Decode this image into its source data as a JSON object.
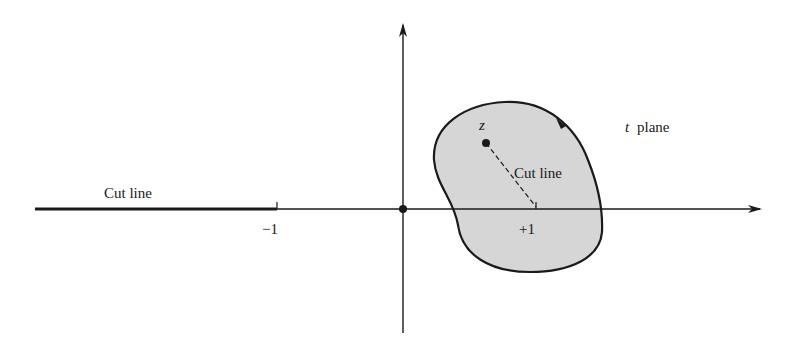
{
  "diagram": {
    "plane_label_var": "t",
    "plane_label_text": "plane",
    "point_label": "z",
    "cut_line_left_label": "Cut line",
    "cut_line_inner_label": "Cut line",
    "tick_minus_one": "−1",
    "tick_plus_one": "+1",
    "colors": {
      "ink": "#1a1a1a",
      "region_fill": "#d6d6d6",
      "background": "#ffffff"
    }
  }
}
